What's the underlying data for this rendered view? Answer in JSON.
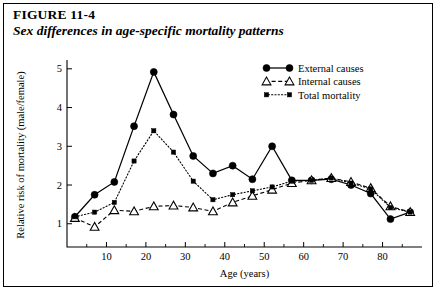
{
  "figure": {
    "label": "FIGURE 11-4",
    "title": "Sex differences in age-specific mortality patterns"
  },
  "chart_data": {
    "type": "line",
    "title": "Sex differences in age-specific mortality patterns",
    "xlabel": "Age (years)",
    "ylabel": "Relative risk of mortality (male/female)",
    "xlim": [
      0,
      90
    ],
    "ylim": [
      0.4,
      5.15
    ],
    "xticks": [
      10,
      20,
      30,
      40,
      50,
      60,
      70,
      80
    ],
    "xticklabels": [
      "10",
      "20",
      "30",
      "40",
      "50",
      "60",
      "70",
      "80"
    ],
    "xminorticks": [
      5,
      15,
      25,
      35,
      45,
      55,
      65,
      75,
      85
    ],
    "yticks": [
      1,
      2,
      3,
      4,
      5
    ],
    "yticklabels": [
      "1",
      "2",
      "3",
      "4",
      "5"
    ],
    "grid": false,
    "legend_position": "top-right",
    "series": [
      {
        "name": "External causes",
        "marker": "filled-circle",
        "line": "solid",
        "x": [
          2,
          7,
          12,
          17,
          22,
          27,
          32,
          37,
          42,
          47,
          52,
          57,
          62,
          67,
          72,
          77,
          82,
          87
        ],
        "y": [
          1.18,
          1.75,
          2.08,
          3.52,
          4.92,
          3.82,
          2.75,
          2.3,
          2.5,
          2.15,
          3.0,
          2.12,
          2.12,
          2.15,
          2.0,
          1.78,
          1.12,
          1.3
        ]
      },
      {
        "name": "Internal causes",
        "marker": "open-triangle",
        "line": "dashed",
        "x": [
          2,
          7,
          12,
          17,
          22,
          27,
          32,
          37,
          42,
          47,
          52,
          57,
          62,
          67,
          72,
          77,
          82,
          87
        ],
        "y": [
          1.15,
          0.92,
          1.35,
          1.32,
          1.45,
          1.47,
          1.42,
          1.32,
          1.55,
          1.72,
          1.88,
          2.05,
          2.12,
          2.18,
          2.08,
          1.92,
          1.45,
          1.3
        ]
      },
      {
        "name": "Total mortality",
        "marker": "filled-square",
        "line": "dotted",
        "x": [
          2,
          7,
          12,
          17,
          22,
          27,
          32,
          37,
          42,
          47,
          52,
          57,
          62,
          67,
          72,
          77,
          82,
          87
        ],
        "y": [
          1.18,
          1.3,
          1.55,
          2.62,
          3.4,
          2.85,
          2.1,
          1.62,
          1.75,
          1.85,
          1.95,
          2.1,
          2.12,
          2.18,
          2.05,
          1.9,
          1.42,
          1.3
        ]
      }
    ]
  },
  "legend": {
    "items": [
      {
        "label": "External causes"
      },
      {
        "label": "Internal causes"
      },
      {
        "label": "Total mortality"
      }
    ]
  }
}
